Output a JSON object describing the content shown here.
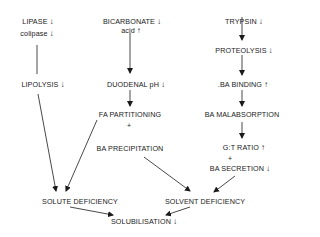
{
  "diagram": {
    "nodes": {
      "lipase": {
        "label": "LIPASE",
        "indicator": "↓"
      },
      "colipase": {
        "label": "colipase",
        "indicator": "↓"
      },
      "bicarbonate": {
        "label": "BICARBONATE",
        "indicator": "↓"
      },
      "acid": {
        "label": "acid",
        "indicator": "↑"
      },
      "trypsin": {
        "label": "TRYPSIN",
        "indicator": "↓"
      },
      "proteolysis": {
        "label": "PROTEOLYSIS",
        "indicator": "↓"
      },
      "lipolysis": {
        "label": "LIPOLYSIS",
        "indicator": "↓"
      },
      "duodenal_ph": {
        "label": "DUODENAL pH",
        "indicator": "↓"
      },
      "ba_binding": {
        "label": ".BA BINDING",
        "indicator": "↑"
      },
      "fa_partitioning": {
        "label": "FA PARTITIONING",
        "indicator": ""
      },
      "ba_malabsorption": {
        "label": "BA MALABSORPTION",
        "indicator": ""
      },
      "ba_precipitation": {
        "label": "BA PRECIPITATION",
        "indicator": ""
      },
      "gt_ratio": {
        "label": "G:T RATIO",
        "indicator": "↑"
      },
      "ba_secretion": {
        "label": "BA SECRETION",
        "indicator": "↓"
      },
      "solute_deficiency": {
        "label": "SOLUTE DEFICIENCY",
        "indicator": ""
      },
      "solvent_deficiency": {
        "label": "SOLVENT DEFICIENCY",
        "indicator": ""
      },
      "solubilisation": {
        "label": "SOLUBILISATION",
        "indicator": "↓"
      }
    },
    "connectors": {
      "plus_fa_ba": "+",
      "plus_gt_ba": "+"
    }
  }
}
